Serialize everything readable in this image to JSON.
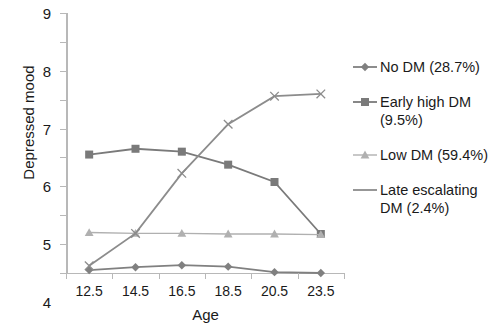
{
  "chart_data": {
    "type": "line",
    "title": "",
    "xlabel": "Age",
    "ylabel": "Depressed mood",
    "categories": [
      "12.5",
      "14.5",
      "16.5",
      "18.5",
      "20.5",
      "23.5"
    ],
    "ylim": [
      0,
      9
    ],
    "yticks": [
      "0",
      "1",
      "2",
      "3",
      "4",
      "5",
      "6",
      "7",
      "8",
      "9"
    ],
    "grid": false,
    "legend_position": "right",
    "series": [
      {
        "name": "No DM (28.7%)",
        "label": "No DM (28.7%)",
        "marker": "diamond",
        "color": "#808080",
        "values": [
          0.1,
          0.2,
          0.27,
          0.22,
          0.03,
          0.0
        ]
      },
      {
        "name": "Early high DM (9.5%)",
        "label": "Early high DM (9.5%)",
        "marker": "square",
        "color": "#7a7a7a",
        "values": [
          4.1,
          4.3,
          4.2,
          3.75,
          3.15,
          1.35
        ]
      },
      {
        "name": "Low DM (59.4%)",
        "label": "Low DM (59.4%)",
        "marker": "triangle",
        "color": "#b0b0b0",
        "values": [
          1.4,
          1.37,
          1.37,
          1.35,
          1.35,
          1.33
        ]
      },
      {
        "name": "Late escalating DM (2.4%)",
        "label": "Late escalating DM (2.4%)",
        "marker": "cross",
        "color": "#8c8c8c",
        "values": [
          0.25,
          1.37,
          3.45,
          5.15,
          6.12,
          6.2
        ]
      }
    ]
  },
  "legend": {
    "items": [
      {
        "label": "No DM (28.7%)"
      },
      {
        "label": "Early high DM (9.5%)"
      },
      {
        "label": "Low DM (59.4%)"
      },
      {
        "label": "Late escalating DM (2.4%)"
      }
    ]
  }
}
